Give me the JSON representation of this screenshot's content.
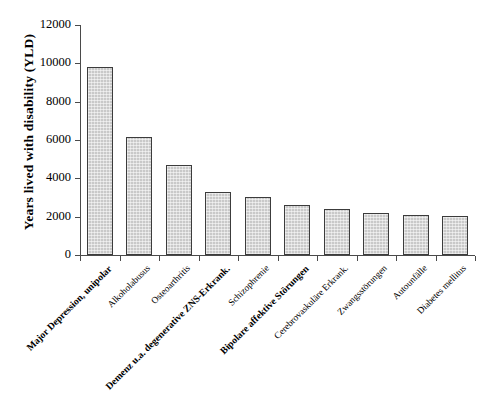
{
  "chart_data": {
    "type": "bar",
    "title": "",
    "xlabel": "",
    "ylabel": "Years lived with disability (YLD)",
    "ylim": [
      0,
      12000
    ],
    "ytick_step": 2000,
    "yticks": [
      "12000",
      "10000",
      "8000",
      "6000",
      "4000",
      "2000",
      "0"
    ],
    "grid": false,
    "legend": "none",
    "bar_fill_color": "#c9c9c9",
    "bar_border_color": "#3c3c3c",
    "categories": [
      "Major Depression, unipolar",
      "Alkoholabusus",
      "Osteoarthritis",
      "Demenz u.a. degenerative ZNS-Erkrank.",
      "Schizophrenie",
      "Bipolare affektive Störungen",
      "Cerebrovaskuläre Erkrank.",
      "Zwangsstörungen",
      "Autounfälle",
      "Diabetes mellitus"
    ],
    "category_emphasis": [
      true,
      false,
      false,
      true,
      false,
      true,
      false,
      false,
      false,
      false
    ],
    "values": [
      9800,
      6150,
      4700,
      3300,
      3050,
      2600,
      2400,
      2200,
      2100,
      2050
    ]
  }
}
